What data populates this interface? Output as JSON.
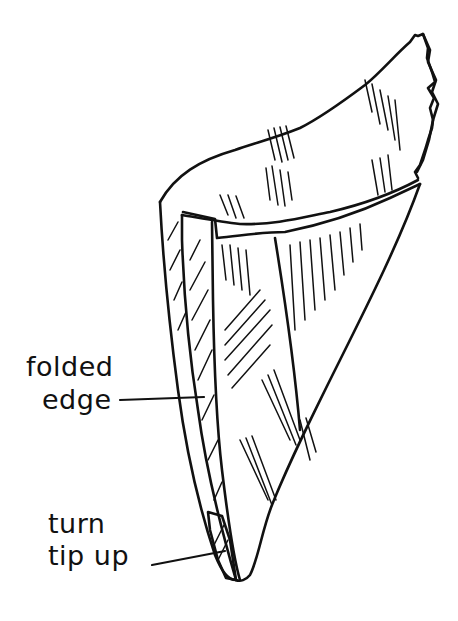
{
  "figure": {
    "colors": {
      "ink": "#111111",
      "background": "#ffffff"
    }
  },
  "labels": {
    "folded_edge": {
      "line1": "folded",
      "line2": "edge"
    },
    "turn_tip_up": {
      "line1": "turn",
      "line2": "tip up"
    }
  }
}
